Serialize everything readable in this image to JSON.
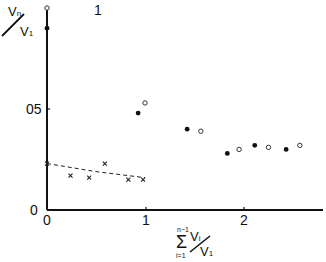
{
  "chart_data": {
    "type": "scatter",
    "title": "",
    "xlabel": "Σ_{i=1}^{n-1} V_i / V_1",
    "ylabel": "V_n / V_1",
    "xlim": [
      0,
      2.85
    ],
    "ylim": [
      0,
      1.0
    ],
    "grid": false,
    "legend": null,
    "x_ticks": [
      "0",
      "1",
      "2"
    ],
    "y_ticks": [
      "0",
      "05",
      "1"
    ],
    "series": [
      {
        "name": "filled circles",
        "marker": "filled-circle",
        "x": [
          0.0,
          0.93,
          1.43,
          1.84,
          2.12,
          2.44
        ],
        "y": [
          0.9,
          0.48,
          0.4,
          0.28,
          0.32,
          0.3
        ]
      },
      {
        "name": "open circles",
        "marker": "open-circle",
        "x": [
          0.0,
          1.0,
          1.57,
          1.96,
          2.26,
          2.58
        ],
        "y": [
          1.0,
          0.53,
          0.39,
          0.3,
          0.31,
          0.32
        ]
      },
      {
        "name": "crosses",
        "marker": "cross",
        "x": [
          0.0,
          0.24,
          0.43,
          0.59,
          0.83,
          0.98
        ],
        "y": [
          0.23,
          0.17,
          0.16,
          0.23,
          0.15,
          0.15
        ]
      },
      {
        "name": "fit (dashed)",
        "type": "line",
        "style": "dashed",
        "x": [
          0.0,
          0.5,
          1.0
        ],
        "y": [
          0.23,
          0.19,
          0.16
        ]
      }
    ]
  },
  "labels": {
    "y_num": "V",
    "y_num_sub": "n",
    "y_den": "V",
    "y_den_sub": "1",
    "x_sigma": "Σ",
    "x_sigma_top": "n−1",
    "x_sigma_bot": "i=1",
    "x_num": "V",
    "x_num_sub": "i",
    "x_den": "V",
    "x_den_sub": "1",
    "tick_x0": "0",
    "tick_x1": "1",
    "tick_x2": "2",
    "tick_y0": "0",
    "tick_y05": "05",
    "tick_y1": "1"
  }
}
